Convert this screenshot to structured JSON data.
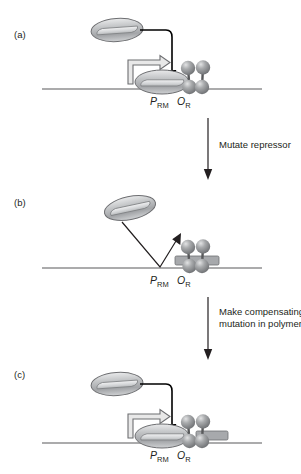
{
  "figure": {
    "kind": "schematic-diagram",
    "background_color": "#ffffff",
    "ink_color": "#231f20"
  },
  "panels": [
    {
      "id": "a",
      "letter": "(a)",
      "site_labels": [
        {
          "symbol": "P",
          "subscript": "RM"
        },
        {
          "symbol": "O",
          "subscript": "R"
        }
      ],
      "elements": {
        "free_polymerase": "polymerase-ellipse",
        "bound_polymerase": "polymerase-ellipse",
        "repressor_dimer": "repressor-dimer",
        "contact_arrow": "contact-arrow",
        "transcription_arrow": "transcription-arrow",
        "dna": "dna-strand"
      },
      "state_note": "wild-type repressor contacts polymerase; transcription on"
    },
    {
      "id": "b",
      "letter": "(b)",
      "site_labels": [
        {
          "symbol": "P",
          "subscript": "RM"
        },
        {
          "symbol": "O",
          "subscript": "R"
        }
      ],
      "elements": {
        "free_polymerase": "polymerase-ellipse",
        "repressor_dimer": "repressor-dimer",
        "bounce_arrow": "bounce-arrow",
        "operator_box": "operator-box",
        "dna": "dna-strand"
      },
      "state_note": "mutant repressor fails to recruit polymerase; transcription off"
    },
    {
      "id": "c",
      "letter": "(c)",
      "site_labels": [
        {
          "symbol": "P",
          "subscript": "RM"
        },
        {
          "symbol": "O",
          "subscript": "R"
        }
      ],
      "elements": {
        "free_polymerase": "polymerase-ellipse",
        "bound_polymerase": "polymerase-ellipse",
        "repressor_dimer": "repressor-dimer",
        "contact_arrow": "contact-arrow",
        "transcription_arrow": "transcription-arrow",
        "operator_box": "operator-box",
        "dna": "dna-strand"
      },
      "state_note": "compensating polymerase mutation restores contact; transcription on"
    }
  ],
  "transitions": [
    {
      "id": "a-to-b",
      "lines": [
        "Mutate repressor"
      ]
    },
    {
      "id": "b-to-c",
      "lines": [
        "Make compensating",
        "mutation in polymerase"
      ]
    }
  ],
  "colors": {
    "dna_stroke": "#58595b",
    "sphere_fill": "#808285",
    "sphere_highlight": "#d9dadb",
    "polymerase_fill": "#b3b5b7",
    "polymerase_highlight": "#e6e7e8",
    "operator_fill": "#a7a9ac",
    "arrow_black": "#000000",
    "transcript_arrow_fill": "#e8e8e8"
  }
}
